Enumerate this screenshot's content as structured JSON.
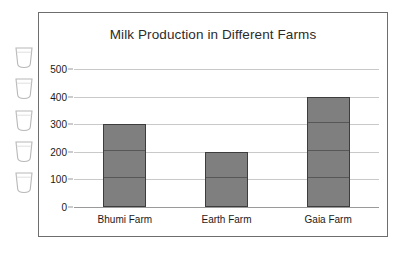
{
  "chart_data": {
    "type": "bar",
    "title": "Milk Production in Different Farms",
    "categories": [
      "Bhumi Farm",
      "Earth Farm",
      "Gaia Farm"
    ],
    "values": [
      300,
      200,
      400
    ],
    "xlabel": "",
    "ylabel": "",
    "ylim": [
      0,
      500
    ],
    "yticks": [
      0,
      100,
      200,
      300,
      400,
      500
    ],
    "ytick_labels": [
      "0",
      "100",
      "200",
      "300",
      "400",
      "500"
    ],
    "grid": true,
    "legend": false,
    "bar_color": "#7f7f7f",
    "bar_edge_color": "#3d3d3d",
    "gridline_color": "#c9c9c9",
    "axis_color": "#9a9a9a",
    "frame_color": "#6e6e6e",
    "text_color": "#1a1a1a"
  },
  "decorations": {
    "glass_icon_name": "milk-glass-icon",
    "glass_icon_count": 5,
    "glass_outline_color": "#b8b8b8"
  }
}
